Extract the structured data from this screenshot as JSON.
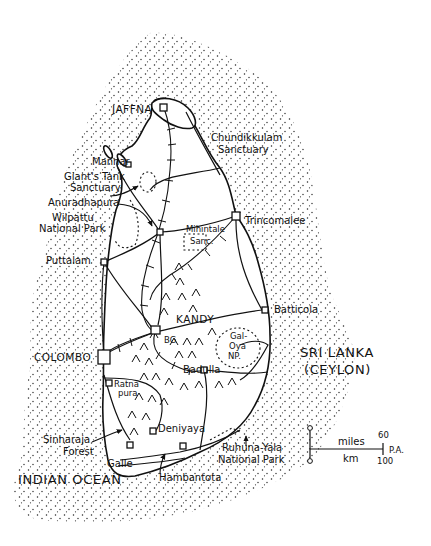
{
  "map": {
    "country": "SRI LANKA",
    "country_alt": "(CEYLON)",
    "sea": "INDIAN OCEAN",
    "places": [
      {
        "id": "jaffna",
        "label": "JAFFNA",
        "x": 112,
        "y": 113,
        "cls": "city-caps"
      },
      {
        "id": "chundikkulam",
        "label": "Chundikkulam",
        "x": 211,
        "y": 141,
        "cls": "place"
      },
      {
        "id": "chundikkulam2",
        "label": "Sanctuary",
        "x": 218,
        "y": 153,
        "cls": "place"
      },
      {
        "id": "mannar",
        "label": "Mannar",
        "x": 92,
        "y": 165,
        "cls": "place"
      },
      {
        "id": "giants-tank",
        "label": "Giant's Tank",
        "x": 64,
        "y": 180,
        "cls": "place"
      },
      {
        "id": "giants-tank2",
        "label": "Sanctuary",
        "x": 70,
        "y": 191,
        "cls": "place"
      },
      {
        "id": "anuradhapura",
        "label": "Anuradhapura",
        "x": 48,
        "y": 206,
        "cls": "place"
      },
      {
        "id": "wilpattu",
        "label": "Wilpattu",
        "x": 52,
        "y": 221,
        "cls": "place"
      },
      {
        "id": "wilpattu2",
        "label": "National Park",
        "x": 39,
        "y": 232,
        "cls": "place"
      },
      {
        "id": "mihintale",
        "label": "Mihintale",
        "x": 190,
        "y": 239,
        "cls": "small"
      },
      {
        "id": "mihintale2",
        "label": "Sanc.",
        "x": 193,
        "y": 248,
        "cls": "small"
      },
      {
        "id": "trincomalee",
        "label": "Trincomalee",
        "x": 245,
        "y": 224,
        "cls": "place"
      },
      {
        "id": "puttalam",
        "label": "Puttalam",
        "x": 46,
        "y": 264,
        "cls": "place"
      },
      {
        "id": "batticola",
        "label": "Batticola",
        "x": 276,
        "y": 313,
        "cls": "place"
      },
      {
        "id": "kandy",
        "label": "KANDY",
        "x": 176,
        "y": 323,
        "cls": "city-caps"
      },
      {
        "id": "bg",
        "label": "BG",
        "x": 165,
        "y": 343,
        "cls": "small"
      },
      {
        "id": "gal-oya",
        "label": "Gal-",
        "x": 232,
        "y": 339,
        "cls": "small"
      },
      {
        "id": "gal-oya2",
        "label": "Oya",
        "x": 230,
        "y": 349,
        "cls": "small"
      },
      {
        "id": "gal-oya3",
        "label": "NP.",
        "x": 229,
        "y": 359,
        "cls": "small"
      },
      {
        "id": "colombo",
        "label": "COLOMBO",
        "x": 34,
        "y": 361,
        "cls": "city-caps"
      },
      {
        "id": "badulla",
        "label": "Badulla",
        "x": 183,
        "y": 373,
        "cls": "place"
      },
      {
        "id": "ratnapura",
        "label": "Ratna",
        "x": 115,
        "y": 385,
        "cls": "small"
      },
      {
        "id": "ratnapura2",
        "label": "pura",
        "x": 118,
        "y": 394,
        "cls": "small"
      },
      {
        "id": "deniyaya",
        "label": "Deniyaya",
        "x": 158,
        "y": 432,
        "cls": "place"
      },
      {
        "id": "sinharaja",
        "label": "Sinharaja",
        "x": 43,
        "y": 443,
        "cls": "place"
      },
      {
        "id": "sinharaja2",
        "label": "Forest",
        "x": 63,
        "y": 455,
        "cls": "place"
      },
      {
        "id": "ruhuna",
        "label": "Ruhuna-Yala",
        "x": 222,
        "y": 451,
        "cls": "place"
      },
      {
        "id": "ruhuna2",
        "label": "National Park",
        "x": 218,
        "y": 463,
        "cls": "place"
      },
      {
        "id": "galle",
        "label": "Galle",
        "x": 107,
        "y": 467,
        "cls": "place"
      },
      {
        "id": "hambantota",
        "label": "Hambantota",
        "x": 159,
        "y": 480,
        "cls": "place"
      }
    ],
    "scale_bar": {
      "zero_top": "0",
      "zero_bottom": "0",
      "unit_top": "miles",
      "unit_bottom": "km",
      "max_top": "60",
      "max_bottom": "100",
      "signature": "P.A."
    }
  }
}
